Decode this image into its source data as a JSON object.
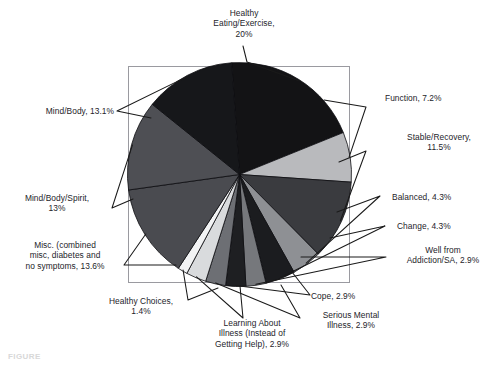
{
  "figure": {
    "caption_fragment": "FIGURE",
    "frame": {
      "x": 128,
      "y": 66,
      "width": 222,
      "height": 217,
      "color": "#9a9aa0"
    }
  },
  "chart_data": {
    "type": "pie",
    "title": "",
    "xlabel": "",
    "ylabel": "",
    "legend_position": "callout-labels",
    "grid": false,
    "total_percent": 100.0,
    "categories": [
      "Healthy Eating/Exercise",
      "Function",
      "Stable/Recovery",
      "Balanced",
      "Change",
      "Well from Addiction/SA",
      "Cope",
      "Serious Mental Illness",
      "Learning About Illness (Instead of Getting Help)",
      "Healthy Choices",
      "Misc. (combined misc, diabetes and no symptoms",
      "Mind/Body/Spirit",
      "Mind/Body"
    ],
    "values": [
      20,
      7.2,
      11.5,
      4.3,
      4.3,
      2.9,
      2.9,
      2.9,
      2.9,
      1.4,
      13.6,
      13,
      13.1
    ],
    "slice_colors": [
      "#131315",
      "#b9babd",
      "#3a3b3f",
      "#8e9094",
      "#1b1c1f",
      "#76787c",
      "#1e1f22",
      "#6d6f74",
      "#d9dbdd",
      "#f2f3f4",
      "#4a4b50",
      "#4e4f54",
      "#16171a"
    ],
    "start_angle_deg": -4,
    "direction": "clockwise"
  },
  "labels": [
    {
      "key": "healthy-eating",
      "text": "Healthy\nEating/Exercise,\n20%"
    },
    {
      "key": "function",
      "text": "Function, 7.2%"
    },
    {
      "key": "stable-recovery",
      "text": "Stable/Recovery,\n11.5%"
    },
    {
      "key": "balanced",
      "text": "Balanced, 4.3%"
    },
    {
      "key": "change",
      "text": "Change, 4.3%"
    },
    {
      "key": "well-from-addiction",
      "text": "Well from\nAddiction/SA, 2.9%"
    },
    {
      "key": "cope",
      "text": "Cope, 2.9%"
    },
    {
      "key": "serious-mental-illness",
      "text": "Serious Mental\nIllness, 2.9%"
    },
    {
      "key": "learning-about-illness",
      "text": "Learning About\nIllness (Instead of\nGetting Help), 2.9%"
    },
    {
      "key": "healthy-choices",
      "text": "Healthy Choices,\n1.4%"
    },
    {
      "key": "misc-combined",
      "text": "Misc. (combined\nmisc, diabetes and\nno symptoms, 13.6%"
    },
    {
      "key": "mind-body-spirit",
      "text": "Mind/Body/Spirit,\n13%"
    },
    {
      "key": "mind-body",
      "text": "Mind/Body, 13.1%"
    }
  ]
}
